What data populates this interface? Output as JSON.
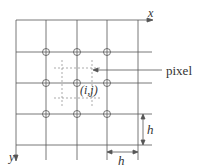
{
  "diagram": {
    "type": "pixel-grid",
    "axes": {
      "x_label": "x",
      "y_label": "y"
    },
    "pixel_label": "pixel",
    "center_label": "(i,j)",
    "spacing_label_vertical": "h",
    "spacing_label_horizontal": "h",
    "grid": {
      "vertical_lines": 5,
      "horizontal_lines": 5,
      "nodes_marked": "3x3 interior circles"
    },
    "colors": {
      "line": "#555555",
      "dashed": "#888888",
      "text": "#333333"
    }
  }
}
